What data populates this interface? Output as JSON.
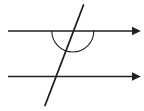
{
  "figure": {
    "background_color": "#ffffff",
    "stroke_color": "#231f20",
    "width": 144,
    "height": 111
  },
  "elements": {
    "parallel_line_top": {
      "name": "top-parallel-line",
      "x1": 8,
      "y1": 31,
      "x2": 136,
      "y2": 31,
      "stroke_width": 1.6,
      "arrowhead": "right",
      "color": "#231f20"
    },
    "parallel_line_bottom": {
      "name": "bottom-parallel-line",
      "x1": 8,
      "y1": 76.5,
      "x2": 136,
      "y2": 76.5,
      "stroke_width": 1.6,
      "arrowhead": "right",
      "color": "#231f20"
    },
    "transversal": {
      "name": "transversal-line",
      "x1": 83.5,
      "y1": 5,
      "x2": 45,
      "y2": 105.5,
      "stroke_width": 1.8,
      "arrowhead": "none",
      "color": "#231f20"
    },
    "angle_arc": {
      "name": "angle-arc",
      "center_x": 72.8,
      "center_y": 31,
      "radius": 21,
      "start_angle_deg": 0,
      "end_angle_deg": 180,
      "side": "below",
      "stroke_width": 1.1,
      "color": "#231f20",
      "path": "M 93.8 31 A 21 21 0 0 1 51.8 31"
    },
    "intersection_top": {
      "name": "top-intersection-point",
      "x": 72.8,
      "y": 31
    },
    "intersection_bottom": {
      "name": "bottom-intersection-point",
      "x": 55.3,
      "y": 76.5
    }
  },
  "arrowhead": {
    "marker_length": 9,
    "marker_half_width": 4.2
  },
  "labels": []
}
